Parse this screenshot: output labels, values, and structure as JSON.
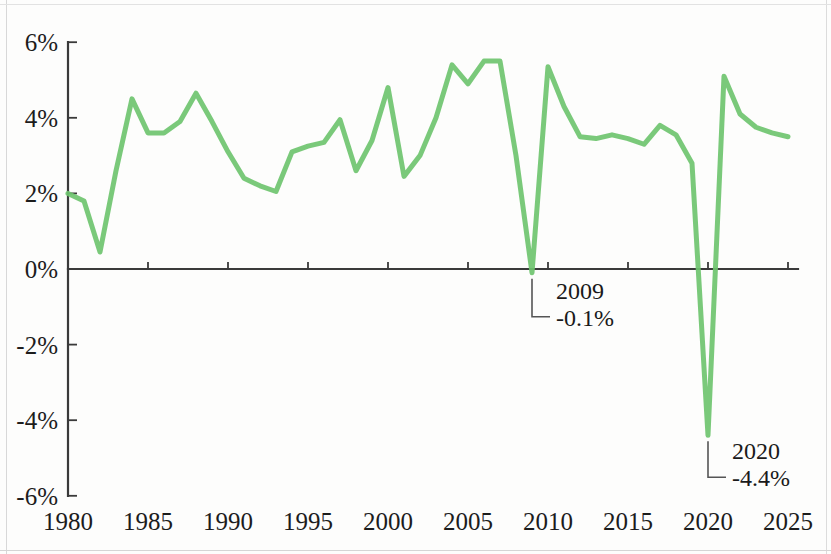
{
  "chart_data": {
    "type": "line",
    "title": "",
    "subtitle": "",
    "xlabel": "",
    "ylabel": "",
    "xlim": [
      1980,
      2025
    ],
    "ylim": [
      -6,
      6
    ],
    "grid": false,
    "legend": null,
    "line_color": "#6fc46f",
    "series": [
      {
        "name": "Growth",
        "x": [
          1980,
          1981,
          1982,
          1983,
          1984,
          1985,
          1986,
          1987,
          1988,
          1989,
          1990,
          1991,
          1992,
          1993,
          1994,
          1995,
          1996,
          1997,
          1998,
          1999,
          2000,
          2001,
          2002,
          2003,
          2004,
          2005,
          2006,
          2007,
          2008,
          2009,
          2010,
          2011,
          2012,
          2013,
          2014,
          2015,
          2016,
          2017,
          2018,
          2019,
          2020,
          2021,
          2022,
          2023,
          2024,
          2025
        ],
        "values": [
          2.0,
          1.8,
          0.45,
          2.6,
          4.5,
          3.6,
          3.6,
          3.9,
          4.65,
          3.9,
          3.1,
          2.4,
          2.2,
          2.05,
          3.1,
          3.25,
          3.35,
          3.95,
          2.6,
          3.4,
          4.8,
          2.45,
          3.0,
          4.0,
          5.4,
          4.9,
          5.5,
          5.5,
          3.0,
          -0.1,
          5.35,
          4.3,
          3.5,
          3.45,
          3.55,
          3.45,
          3.3,
          3.8,
          3.55,
          2.8,
          -4.4,
          5.1,
          4.1,
          3.75,
          3.6,
          3.5
        ]
      }
    ],
    "y_ticks": [
      {
        "value": 6,
        "label": "6%"
      },
      {
        "value": 4,
        "label": "4%"
      },
      {
        "value": 2,
        "label": "2%"
      },
      {
        "value": 0,
        "label": "0%"
      },
      {
        "value": -2,
        "label": "-2%"
      },
      {
        "value": -4,
        "label": "-4%"
      },
      {
        "value": -6,
        "label": "-6%"
      }
    ],
    "x_ticks": [
      {
        "value": 1980,
        "label": "1980"
      },
      {
        "value": 1985,
        "label": "1985"
      },
      {
        "value": 1990,
        "label": "1990"
      },
      {
        "value": 1995,
        "label": "1995"
      },
      {
        "value": 2000,
        "label": "2000"
      },
      {
        "value": 2005,
        "label": "2005"
      },
      {
        "value": 2010,
        "label": "2010"
      },
      {
        "value": 2015,
        "label": "2015"
      },
      {
        "value": 2020,
        "label": "2020"
      },
      {
        "value": 2025,
        "label": "2025"
      }
    ],
    "annotations": [
      {
        "x": 2009,
        "y": -0.1,
        "year_label": "2009",
        "value_label": "-0.1%"
      },
      {
        "x": 2020,
        "y": -4.4,
        "year_label": "2020",
        "value_label": "-4.4%"
      }
    ]
  }
}
